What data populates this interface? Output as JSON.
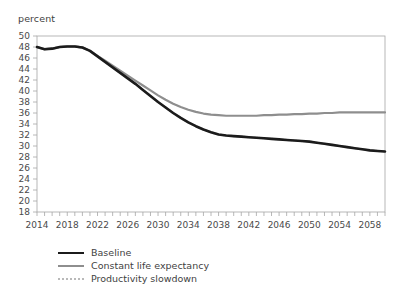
{
  "chart_data": {
    "type": "line",
    "title": "",
    "subtitle": "",
    "ylabel": "percent",
    "xlabel": "",
    "xlim": [
      2014,
      2060
    ],
    "ylim": [
      18,
      50
    ],
    "y_tick_step": 2,
    "x_tick_step": 1,
    "x_label_step": 4,
    "grid": false,
    "legend_position": "bottom-left",
    "yticks": [
      50,
      48,
      46,
      44,
      42,
      40,
      38,
      36,
      34,
      32,
      30,
      28,
      26,
      24,
      22,
      20,
      18
    ],
    "xticks": [
      2014,
      2018,
      2022,
      2026,
      2030,
      2034,
      2038,
      2042,
      2046,
      2050,
      2054,
      2058
    ],
    "x": [
      2014,
      2015,
      2016,
      2017,
      2018,
      2019,
      2020,
      2021,
      2022,
      2023,
      2024,
      2025,
      2026,
      2027,
      2028,
      2029,
      2030,
      2031,
      2032,
      2033,
      2034,
      2035,
      2036,
      2037,
      2038,
      2039,
      2040,
      2041,
      2042,
      2043,
      2044,
      2045,
      2046,
      2047,
      2048,
      2049,
      2050,
      2051,
      2052,
      2053,
      2054,
      2055,
      2056,
      2057,
      2058,
      2059,
      2060
    ],
    "series": [
      {
        "name": "Baseline",
        "color": "#1b1b1b",
        "style": "solid",
        "width": 2.6,
        "values": [
          48.0,
          47.6,
          47.7,
          48.0,
          48.1,
          48.1,
          47.9,
          47.3,
          46.3,
          45.3,
          44.3,
          43.3,
          42.3,
          41.3,
          40.2,
          39.1,
          38.0,
          37.0,
          36.0,
          35.1,
          34.3,
          33.6,
          33.0,
          32.5,
          32.1,
          31.9,
          31.8,
          31.7,
          31.6,
          31.5,
          31.4,
          31.3,
          31.2,
          31.1,
          31.0,
          30.9,
          30.8,
          30.6,
          30.4,
          30.2,
          30.0,
          29.8,
          29.6,
          29.4,
          29.2,
          29.1,
          29.0
        ]
      },
      {
        "name": "Constant life expectancy",
        "color": "#8e8e8e",
        "style": "solid",
        "width": 2.2,
        "values": [
          48.0,
          47.6,
          47.7,
          48.0,
          48.1,
          48.1,
          47.9,
          47.3,
          46.4,
          45.5,
          44.6,
          43.7,
          42.8,
          41.9,
          41.0,
          40.1,
          39.2,
          38.4,
          37.7,
          37.1,
          36.6,
          36.2,
          35.9,
          35.7,
          35.6,
          35.5,
          35.5,
          35.5,
          35.5,
          35.5,
          35.6,
          35.6,
          35.7,
          35.7,
          35.8,
          35.8,
          35.9,
          35.9,
          36.0,
          36.0,
          36.1,
          36.1,
          36.1,
          36.1,
          36.1,
          36.1,
          36.1
        ]
      },
      {
        "name": "Productivity slowdown",
        "color": "#c2c2c2",
        "style": "dotted",
        "width": 2.2,
        "values": [
          48.0,
          47.6,
          47.7,
          48.0,
          48.1,
          48.1,
          47.9,
          47.3,
          46.3,
          45.3,
          44.3,
          43.3,
          42.3,
          41.3,
          40.2,
          39.1,
          38.0,
          37.0,
          36.0,
          35.1,
          34.3,
          33.6,
          33.0,
          32.5,
          32.1,
          31.9,
          31.8,
          31.7,
          31.6,
          31.5,
          31.4,
          31.3,
          31.2,
          31.1,
          31.0,
          30.9,
          30.8,
          30.6,
          30.4,
          30.2,
          30.0,
          29.8,
          29.6,
          29.4,
          29.2,
          29.1,
          29.0
        ]
      }
    ]
  },
  "legend": {
    "items": [
      {
        "label": "Baseline"
      },
      {
        "label": "Constant life expectancy"
      },
      {
        "label": "Productivity slowdown"
      }
    ]
  }
}
